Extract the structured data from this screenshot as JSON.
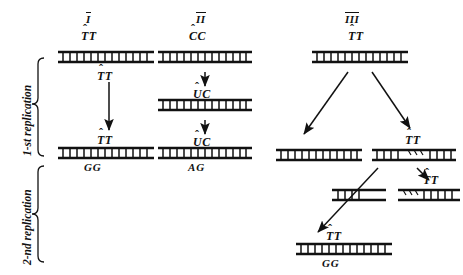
{
  "figure": {
    "type": "biology-diagram",
    "columns": [
      {
        "id": "I",
        "roman": "I"
      },
      {
        "id": "II",
        "roman": "II"
      },
      {
        "id": "III",
        "roman": "III"
      }
    ],
    "stage_labels": [
      {
        "id": "first",
        "text": "1-st replication"
      },
      {
        "id": "second",
        "text": "2-nd replication"
      }
    ],
    "column_I": {
      "top_dimer": "TT",
      "mid_dimer": "TT",
      "result_dimer": "TT",
      "result_basepair": "GG"
    },
    "column_II": {
      "top_dimer": "CC",
      "mid_dimer": "UC",
      "result_dimer": "UC",
      "result_basepair": "AG"
    },
    "column_III": {
      "top_dimer": "TT",
      "branch_right_dimer": "TT",
      "fragment_dimer": "TT",
      "result_dimer": "TT",
      "result_basepair": "GG"
    }
  },
  "style": {
    "ink": "#111111",
    "background": "#ffffff"
  }
}
